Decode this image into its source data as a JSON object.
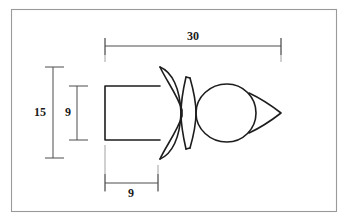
{
  "drawing": {
    "title": "Mechanical part outline with dimensions",
    "background_color": "#ffffff",
    "line_color": "#1d1d1d",
    "dimension_color": "#4d4d4d",
    "frame_color": "#9a9a9a",
    "units_note": ""
  },
  "dimensions": {
    "overall_length": {
      "label": "30",
      "orientation": "horizontal",
      "position": "top"
    },
    "flange_height": {
      "label": "15",
      "orientation": "vertical",
      "position": "left-outer"
    },
    "shank_height": {
      "label": "9",
      "orientation": "vertical",
      "position": "left-inner"
    },
    "shank_length": {
      "label": "9",
      "orientation": "horizontal",
      "position": "bottom"
    }
  },
  "part": {
    "features": [
      {
        "name": "rectangular-shank"
      },
      {
        "name": "bell-flange"
      },
      {
        "name": "collar-ring"
      },
      {
        "name": "bulb-head"
      },
      {
        "name": "pointed-tip"
      }
    ]
  }
}
